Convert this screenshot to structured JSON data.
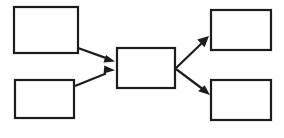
{
  "diagram": {
    "type": "flowchart",
    "orientation": "left-to-right",
    "pattern": "two sources converge into one hub, hub diverges into two targets",
    "canvas": {
      "width": 284,
      "height": 138,
      "background_color": "#ffffff"
    },
    "style": {
      "box_fill": "#ffffff",
      "box_stroke": "#1c1c1c",
      "box_stroke_width": 2.2,
      "edge_stroke": "#1c1c1c",
      "edge_stroke_width": 2.2,
      "arrowhead_fill": "#1c1c1c",
      "arrowhead_style": "filled-triangle"
    },
    "nodes": [
      {
        "id": "source-top",
        "label": "",
        "role": "input",
        "x": 14,
        "y": 7,
        "width": 64,
        "height": 46
      },
      {
        "id": "source-bottom",
        "label": "",
        "role": "input",
        "x": 15,
        "y": 80,
        "width": 59,
        "height": 38
      },
      {
        "id": "hub-center",
        "label": "",
        "role": "process",
        "x": 117,
        "y": 48,
        "width": 58,
        "height": 40
      },
      {
        "id": "target-top",
        "label": "",
        "role": "output",
        "x": 211,
        "y": 10,
        "width": 60,
        "height": 40
      },
      {
        "id": "target-bottom",
        "label": "",
        "role": "output",
        "x": 211,
        "y": 80,
        "width": 60,
        "height": 40
      }
    ],
    "edges": [
      {
        "id": "edge-source-top-to-hub",
        "from": "source-top",
        "to": "hub-center",
        "label": "",
        "direction": "down-right",
        "x1": 78,
        "y1": 48,
        "x2": 115,
        "y2": 61
      },
      {
        "id": "edge-source-bottom-to-hub",
        "from": "source-bottom",
        "to": "hub-center",
        "label": "",
        "direction": "up-right",
        "x1": 75,
        "y1": 86,
        "x2": 115,
        "y2": 70
      },
      {
        "id": "edge-hub-to-target-top",
        "from": "hub-center",
        "to": "target-top",
        "label": "",
        "direction": "up-right",
        "x1": 176,
        "y1": 68,
        "x2": 209,
        "y2": 36
      },
      {
        "id": "edge-hub-to-target-bottom",
        "from": "hub-center",
        "to": "target-bottom",
        "label": "",
        "direction": "down-right",
        "x1": 176,
        "y1": 69,
        "x2": 210,
        "y2": 95
      }
    ]
  }
}
